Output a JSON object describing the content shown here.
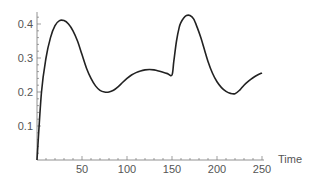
{
  "chart_data": {
    "type": "line",
    "title": "",
    "xlabel": "Time",
    "ylabel": "",
    "xlim": [
      0,
      250
    ],
    "ylim": [
      0,
      0.43
    ],
    "grid": false,
    "x_ticks": [
      50,
      100,
      150,
      200,
      250
    ],
    "x_tick_labels": [
      "50",
      "100",
      "150",
      "200",
      "250"
    ],
    "y_ticks": [
      0.1,
      0.2,
      0.3,
      0.4
    ],
    "y_tick_labels": [
      "0.1",
      "0.2",
      "0.3",
      "0.4"
    ],
    "x_minor_step": 10,
    "y_minor_step": 0.02,
    "line_color": "#222222",
    "series": [
      {
        "name": "series",
        "x": [
          0,
          5,
          10,
          15,
          20,
          25,
          30,
          35,
          40,
          45,
          50,
          55,
          60,
          65,
          70,
          75,
          80,
          85,
          90,
          95,
          100,
          105,
          110,
          115,
          120,
          125,
          130,
          135,
          140,
          145,
          150,
          152,
          155,
          158,
          160,
          163,
          166,
          170,
          174,
          178,
          182,
          186,
          190,
          195,
          200,
          205,
          210,
          215,
          220,
          225,
          230,
          235,
          240,
          245,
          250
        ],
        "values": [
          0,
          0.2,
          0.3,
          0.36,
          0.395,
          0.41,
          0.41,
          0.4,
          0.38,
          0.35,
          0.31,
          0.27,
          0.24,
          0.218,
          0.205,
          0.2,
          0.2,
          0.205,
          0.215,
          0.228,
          0.24,
          0.25,
          0.257,
          0.262,
          0.265,
          0.266,
          0.265,
          0.262,
          0.258,
          0.254,
          0.25,
          0.29,
          0.35,
          0.39,
          0.405,
          0.418,
          0.425,
          0.425,
          0.415,
          0.39,
          0.36,
          0.325,
          0.29,
          0.255,
          0.23,
          0.213,
          0.202,
          0.196,
          0.195,
          0.205,
          0.22,
          0.232,
          0.242,
          0.25,
          0.256
        ]
      }
    ]
  }
}
